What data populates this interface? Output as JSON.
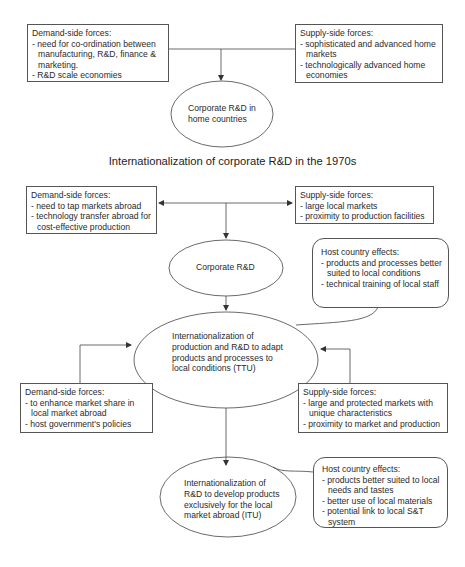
{
  "diagram": {
    "section_title": "Internationalization of corporate R&D in the 1970s",
    "top": {
      "demand_box": {
        "heading": "Demand-side forces:",
        "items": [
          "need for co-ordination between manufacturing, R&D, finance & marketing.",
          "R&D scale economies"
        ]
      },
      "supply_box": {
        "heading": "Supply-side forces:",
        "items": [
          "sophisticated and advanced home markets",
          "technologically advanced home economies"
        ]
      },
      "ellipse": {
        "label": "Corporate R&D in home countries"
      }
    },
    "middle": {
      "demand_box": {
        "heading": "Demand-side forces:",
        "items": [
          "need to tap markets abroad",
          "technology transfer abroad for cost-effective production"
        ]
      },
      "supply_box": {
        "heading": "Supply-side forces:",
        "items": [
          "large local markets",
          "proximity to production facilities"
        ]
      },
      "ellipse_corporate": {
        "label": "Corporate R&D"
      },
      "host_effects": {
        "heading": "Host country effects:",
        "items": [
          "products and processes better suited to local conditions",
          "technical training of local staff"
        ]
      },
      "ellipse_ttu": {
        "label": "Internationalization of production and R&D to adapt products and processes to local conditions (TTU)"
      }
    },
    "lower": {
      "demand_box": {
        "heading": "Demand-side forces:",
        "items": [
          "to enhance market share in local market abroad",
          "host government's policies"
        ]
      },
      "supply_box": {
        "heading": "Supply-side forces:",
        "items": [
          "large and protected markets with unique characteristics",
          "proximity to market and production"
        ]
      },
      "ellipse_itu": {
        "label": "Internationalization of R&D to develop products exclusively for the local market abroad (ITU)"
      },
      "host_effects": {
        "heading": "Host country effects:",
        "items": [
          "products better suited to local needs and tastes",
          "better use of local materials",
          "potential link to local S&T system"
        ]
      }
    },
    "colors": {
      "line": "#444444",
      "text": "#2a2a2a",
      "background": "#ffffff"
    }
  }
}
